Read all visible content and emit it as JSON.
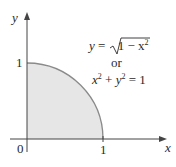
{
  "diagram": {
    "axes": {
      "x_label": "x",
      "y_label": "y",
      "origin_label": "0",
      "x_tick_label": "1",
      "y_tick_label": "1"
    },
    "equation": {
      "line1_lhs": "y",
      "line1_eq": " = ",
      "line1_sqrt_body": "1 − x",
      "line1_exp": "2",
      "connector": "or",
      "line3_x": "x",
      "line3_x_exp": "2",
      "line3_plus": " + ",
      "line3_y": "y",
      "line3_y_exp": "2",
      "line3_rhs": " = 1"
    },
    "region": {
      "description": "Quarter unit disk in first quadrant, shaded",
      "fill_color": "#e6e6e6",
      "curve_color": "#8a8a8a"
    }
  }
}
